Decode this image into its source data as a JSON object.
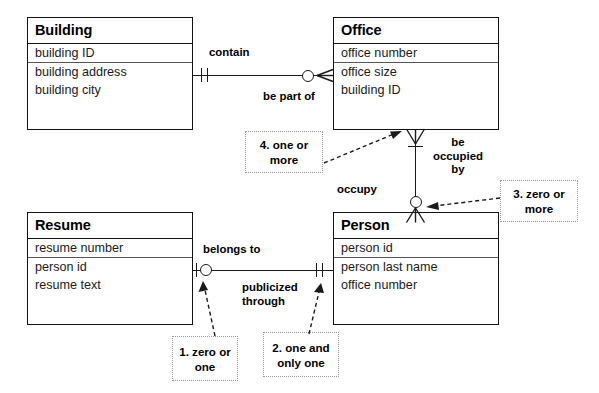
{
  "diagram": {
    "entities": [
      {
        "id": "building",
        "name": "Building",
        "attributes": [
          "building ID",
          "building address",
          "building city"
        ],
        "primary_key": "building ID"
      },
      {
        "id": "office",
        "name": "Office",
        "attributes": [
          "office number",
          "office size",
          "building ID"
        ],
        "primary_key": "office number"
      },
      {
        "id": "resume",
        "name": "Resume",
        "attributes": [
          "resume number",
          "person id",
          "resume text"
        ],
        "primary_key": "resume number"
      },
      {
        "id": "person",
        "name": "Person",
        "attributes": [
          "person id",
          "person last name",
          "office number"
        ],
        "primary_key": "person id"
      }
    ],
    "relationships": [
      {
        "id": "building-office",
        "from": "Building",
        "to": "Office",
        "verb_from": "contain",
        "verb_to": "be part of",
        "cardinality_from": "one and only one",
        "cardinality_to": "zero or more"
      },
      {
        "id": "office-person",
        "from": "Office",
        "to": "Person",
        "verb_from": "occupy",
        "verb_to": "be occupied by",
        "cardinality_from": "one or more",
        "cardinality_to": "zero or more"
      },
      {
        "id": "resume-person",
        "from": "Resume",
        "to": "Person",
        "verb_from": "belongs to",
        "verb_to": "publicized through",
        "cardinality_from": "zero or one",
        "cardinality_to": "one and only one"
      }
    ],
    "verb_labels": {
      "contain": "contain",
      "be_part_of": "be part of",
      "occupy": "occupy",
      "be_occupied_by_line1": "be",
      "be_occupied_by_line2": "occupied",
      "be_occupied_by_line3": "by",
      "belongs_to": "belongs to",
      "publicized_line1": "publicized",
      "publicized_line2": "through"
    },
    "notes": [
      {
        "id": "note-1",
        "text": "1. zero or one"
      },
      {
        "id": "note-2",
        "text": "2. one and only one"
      },
      {
        "id": "note-3",
        "text": "3. zero or more"
      },
      {
        "id": "note-4",
        "text": "4. one or more"
      }
    ],
    "colors": {
      "line": "#1a1a1a",
      "entity_border": "#111111",
      "note_border": "#9a9a9a",
      "background": "#ffffff",
      "text": "#000000"
    }
  }
}
